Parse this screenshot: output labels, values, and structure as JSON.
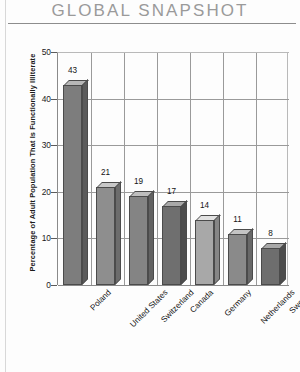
{
  "header": {
    "title": "GLOBAL SNAPSHOT"
  },
  "chart_data": {
    "type": "bar",
    "title": "GLOBAL SNAPSHOT",
    "xlabel": "",
    "ylabel": "Percentage of Adult Population That Is Functionally Illiterate",
    "categories": [
      "Poland",
      "United States",
      "Switzerland",
      "Canada",
      "Germany",
      "Netherlands",
      "Sweden"
    ],
    "values": [
      43,
      21,
      19,
      17,
      14,
      11,
      8
    ],
    "ylim": [
      0,
      50
    ],
    "yticks": [
      0,
      10,
      20,
      30,
      40,
      50
    ],
    "ytick_labels": [
      "0",
      "10",
      "20",
      "30",
      "40",
      "50"
    ],
    "grid": true,
    "legend": "none",
    "data_labels": [
      "43",
      "21",
      "19",
      "17",
      "14",
      "11",
      "8"
    ],
    "style": "3d-bars-grayscale",
    "bar_colors": [
      "#7d7d7d",
      "#8e8e8e",
      "#848484",
      "#6f6f6f",
      "#a8a8a8",
      "#8a8a8a",
      "#6e6e6e"
    ]
  },
  "colors": {
    "title": "#9a9a9a",
    "axis": "#8a8a8a",
    "grid": "#9a9a9a",
    "text": "#141414",
    "background": "#fdfdfd"
  }
}
